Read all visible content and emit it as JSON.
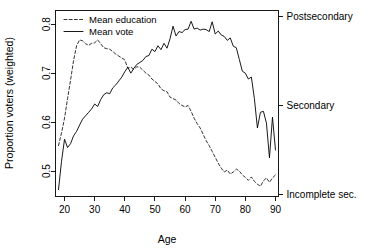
{
  "chart_data": {
    "type": "line",
    "title": "",
    "xlabel": "Age",
    "ylabel": "Proportion voters (weighted)",
    "xlim": [
      17,
      91
    ],
    "ylim": [
      0.448,
      0.828
    ],
    "grid": false,
    "legend_position": "top-left",
    "x_ticks": [
      20,
      30,
      40,
      50,
      60,
      70,
      80,
      90
    ],
    "x_tick_labels": [
      "20",
      "30",
      "40",
      "50",
      "60",
      "70",
      "80",
      "90"
    ],
    "y_ticks": [
      0.5,
      0.6,
      0.7,
      0.8
    ],
    "y_tick_labels": [
      "0.5",
      "0.6",
      "0.7",
      "0.8"
    ],
    "right_axis": {
      "label": "",
      "ticks": [
        0.8165,
        0.6335,
        0.4525
      ],
      "tick_labels": [
        "Postsecondary",
        "Secondary",
        "Incomplete sec."
      ]
    },
    "series": [
      {
        "name": "Mean education",
        "style": "dashed",
        "color": "#000000",
        "x": [
          18,
          19,
          20,
          21,
          22,
          23,
          24,
          25,
          26,
          27,
          28,
          29,
          30,
          31,
          32,
          33,
          34,
          35,
          36,
          37,
          38,
          39,
          40,
          41,
          42,
          43,
          44,
          45,
          46,
          47,
          48,
          49,
          50,
          51,
          52,
          53,
          54,
          55,
          56,
          57,
          58,
          59,
          60,
          61,
          62,
          63,
          64,
          65,
          66,
          67,
          68,
          69,
          70,
          71,
          72,
          73,
          74,
          75,
          76,
          77,
          78,
          79,
          80,
          81,
          82,
          83,
          84,
          85,
          86,
          87,
          88,
          89,
          90
        ],
        "values": [
          0.552,
          0.578,
          0.608,
          0.648,
          0.686,
          0.726,
          0.756,
          0.768,
          0.766,
          0.76,
          0.757,
          0.761,
          0.762,
          0.768,
          0.76,
          0.752,
          0.75,
          0.749,
          0.744,
          0.739,
          0.735,
          0.731,
          0.727,
          0.71,
          0.712,
          0.708,
          0.713,
          0.712,
          0.706,
          0.7,
          0.696,
          0.688,
          0.683,
          0.678,
          0.668,
          0.664,
          0.662,
          0.651,
          0.648,
          0.645,
          0.638,
          0.634,
          0.631,
          0.634,
          0.622,
          0.608,
          0.597,
          0.588,
          0.575,
          0.562,
          0.552,
          0.54,
          0.528,
          0.516,
          0.506,
          0.498,
          0.502,
          0.494,
          0.498,
          0.504,
          0.5,
          0.492,
          0.487,
          0.481,
          0.488,
          0.479,
          0.473,
          0.469,
          0.48,
          0.486,
          0.477,
          0.486,
          0.492
        ]
      },
      {
        "name": "Mean vote",
        "style": "solid",
        "color": "#000000",
        "x": [
          18,
          19,
          20,
          21,
          22,
          23,
          24,
          25,
          26,
          27,
          28,
          29,
          30,
          31,
          32,
          33,
          34,
          35,
          36,
          37,
          38,
          39,
          40,
          41,
          42,
          43,
          44,
          45,
          46,
          47,
          48,
          49,
          50,
          51,
          52,
          53,
          54,
          55,
          56,
          57,
          58,
          59,
          60,
          61,
          62,
          63,
          64,
          65,
          66,
          67,
          68,
          69,
          70,
          71,
          72,
          73,
          74,
          75,
          76,
          77,
          78,
          79,
          80,
          81,
          82,
          83,
          84,
          85,
          86,
          87,
          88,
          89,
          90
        ],
        "values": [
          0.462,
          0.52,
          0.565,
          0.548,
          0.556,
          0.572,
          0.581,
          0.594,
          0.606,
          0.613,
          0.62,
          0.627,
          0.637,
          0.632,
          0.646,
          0.656,
          0.66,
          0.658,
          0.67,
          0.676,
          0.684,
          0.692,
          0.703,
          0.712,
          0.7,
          0.71,
          0.718,
          0.722,
          0.726,
          0.734,
          0.736,
          0.749,
          0.744,
          0.756,
          0.748,
          0.761,
          0.751,
          0.77,
          0.796,
          0.776,
          0.785,
          0.783,
          0.789,
          0.79,
          0.806,
          0.79,
          0.792,
          0.788,
          0.79,
          0.789,
          0.785,
          0.805,
          0.78,
          0.786,
          0.778,
          0.775,
          0.767,
          0.772,
          0.755,
          0.752,
          0.728,
          0.704,
          0.7,
          0.688,
          0.692,
          0.648,
          0.588,
          0.62,
          0.622,
          0.598,
          0.527,
          0.61,
          0.543
        ]
      }
    ]
  },
  "legend": {
    "items": [
      {
        "label": "Mean education",
        "style": "dashed"
      },
      {
        "label": "Mean vote",
        "style": "solid"
      }
    ]
  }
}
